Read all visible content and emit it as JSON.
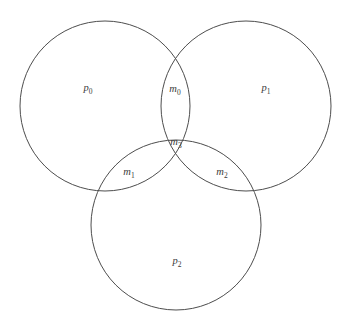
{
  "diagram": {
    "type": "venn-3-set",
    "background_color": "#ffffff",
    "stroke_color": "#4d4d4d",
    "label_color": "#3a3a3a",
    "circles": [
      {
        "id": "p0",
        "name": "left-circle",
        "cx": 105,
        "cy": 106,
        "r": 85
      },
      {
        "id": "p1",
        "name": "right-circle",
        "cx": 246,
        "cy": 106,
        "r": 85
      },
      {
        "id": "p2",
        "name": "bottom-circle",
        "cx": 176,
        "cy": 225,
        "r": 85
      }
    ],
    "labels": [
      {
        "id": "p0",
        "base": "p",
        "sub": "0",
        "x": 88,
        "y": 89,
        "region": "left-only"
      },
      {
        "id": "p1",
        "base": "p",
        "sub": "1",
        "x": 266,
        "y": 89,
        "region": "right-only"
      },
      {
        "id": "p2",
        "base": "p",
        "sub": "2",
        "x": 177,
        "y": 262,
        "region": "bottom-only"
      },
      {
        "id": "m0",
        "base": "m",
        "sub": "0",
        "x": 175,
        "y": 90,
        "region": "left-right"
      },
      {
        "id": "m1",
        "base": "m",
        "sub": "1",
        "x": 129,
        "y": 173,
        "region": "left-bottom"
      },
      {
        "id": "m2",
        "base": "m",
        "sub": "2",
        "x": 222,
        "y": 173,
        "region": "right-bottom"
      },
      {
        "id": "m3",
        "base": "m",
        "sub": "3",
        "x": 176,
        "y": 143,
        "region": "all-three"
      }
    ]
  }
}
